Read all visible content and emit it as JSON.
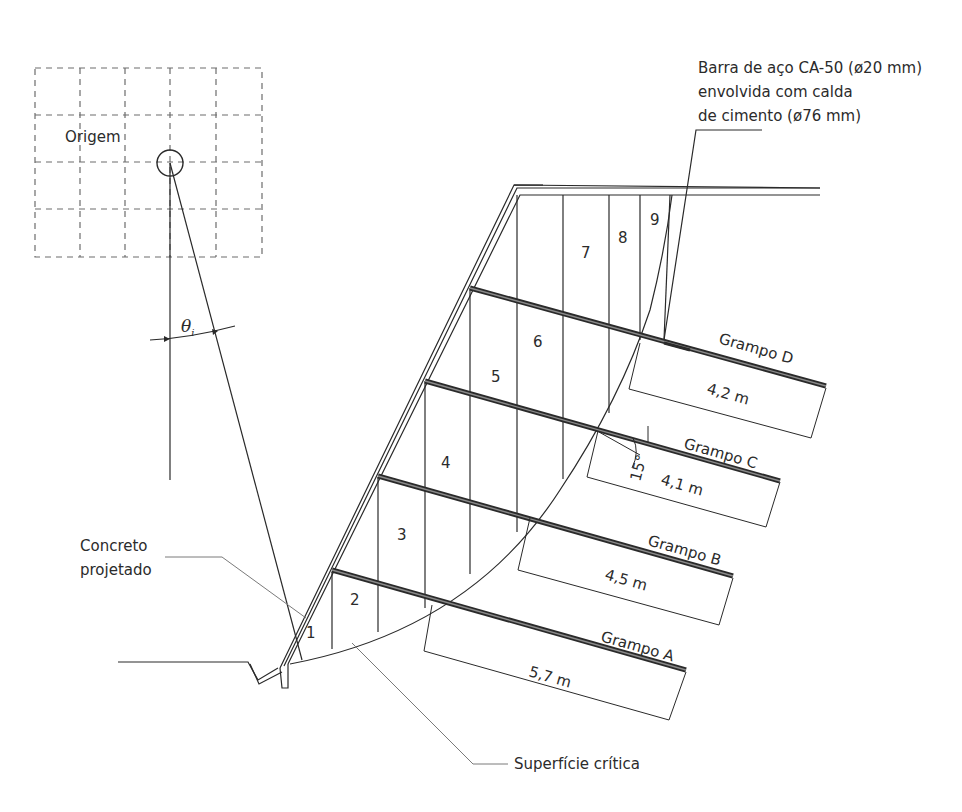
{
  "diagram": {
    "labels": {
      "origin": "Origem",
      "theta": "θ",
      "theta_sub": "i",
      "shotcrete_line1": "Concreto",
      "shotcrete_line2": "projetado",
      "critical_surface": "Superfície crítica",
      "bar_line1": "Barra de aço CA-50 (ø20 mm)",
      "bar_line2": "envolvida com calda",
      "bar_line3": "de cimento (ø76 mm)",
      "angle": "15°"
    },
    "slices": [
      {
        "id": "1",
        "label": "1"
      },
      {
        "id": "2",
        "label": "2"
      },
      {
        "id": "3",
        "label": "3"
      },
      {
        "id": "4",
        "label": "4"
      },
      {
        "id": "5",
        "label": "5"
      },
      {
        "id": "6",
        "label": "6"
      },
      {
        "id": "7",
        "label": "7"
      },
      {
        "id": "8",
        "label": "8"
      },
      {
        "id": "9",
        "label": "9"
      }
    ],
    "nails": [
      {
        "name": "Grampo A",
        "length": "5,7 m"
      },
      {
        "name": "Grampo B",
        "length": "4,5 m"
      },
      {
        "name": "Grampo C",
        "length": "4,1 m"
      },
      {
        "name": "Grampo D",
        "length": "4,2 m"
      }
    ],
    "colors": {
      "line": "#2a2a2a",
      "grid": "#6d6d6d",
      "leader": "#7a7a7a",
      "text": "#2b2b2b"
    }
  }
}
